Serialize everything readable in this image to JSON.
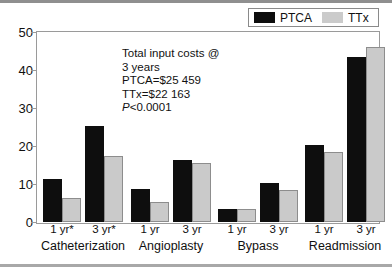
{
  "legend": {
    "entries": [
      {
        "label": "PTCA",
        "color": "#0e0e0e",
        "swatch_name": "legend-swatch-ptca"
      },
      {
        "label": "TTx",
        "color": "#cacaca",
        "swatch_name": "legend-swatch-ttx"
      }
    ]
  },
  "annotation": {
    "line1": "Total input costs @",
    "line2": "3 years",
    "line3": "PTCA=$25 459",
    "line4": "TTx=$22 163",
    "line5_italic": "P",
    "line5_rest": "<0.0001"
  },
  "axis": {
    "y_ticks": [
      "0",
      "10",
      "20",
      "30",
      "40",
      "50"
    ]
  },
  "groups": [
    {
      "name": "Catheterization",
      "sub": [
        "1 yr*",
        "3 yr*"
      ]
    },
    {
      "name": "Angioplasty",
      "sub": [
        "1 yr",
        "3 yr"
      ]
    },
    {
      "name": "Bypass",
      "sub": [
        "1 yr",
        "3 yr"
      ]
    },
    {
      "name": "Readmission",
      "sub": [
        "1 yr",
        "3 yr"
      ]
    }
  ],
  "chart_data": {
    "type": "bar",
    "title": "",
    "xlabel": "",
    "ylabel": "",
    "ylim": [
      0,
      50
    ],
    "yticks": [
      0,
      10,
      20,
      30,
      40,
      50
    ],
    "grid": false,
    "legend_position": "top-right",
    "categories": [
      "Catheterization 1 yr*",
      "Catheterization 3 yr*",
      "Angioplasty 1 yr",
      "Angioplasty 3 yr",
      "Bypass 1 yr",
      "Bypass 3 yr",
      "Readmission 1 yr",
      "Readmission 3 yr"
    ],
    "series": [
      {
        "name": "PTCA",
        "color": "#0e0e0e",
        "values": [
          11.2,
          25.2,
          8.7,
          16.4,
          3.3,
          10.2,
          20.2,
          43.5
        ]
      },
      {
        "name": "TTx",
        "color": "#cacaca",
        "values": [
          6.3,
          17.5,
          5.3,
          15.4,
          3.3,
          8.4,
          18.3,
          46.0
        ]
      }
    ],
    "annotations": [
      "Total input costs @",
      "3 years",
      "PTCA=$25 459",
      "TTx=$22 163",
      "P<0.0001"
    ]
  }
}
